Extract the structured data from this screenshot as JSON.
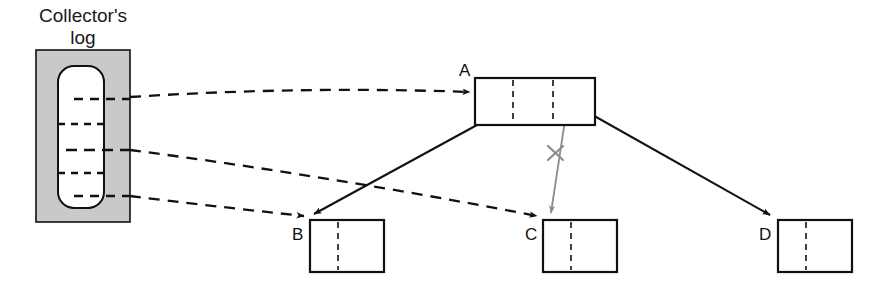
{
  "diagram": {
    "title": {
      "line1": "Collector's",
      "line2": "log"
    },
    "colors": {
      "stroke": "#111111",
      "log_fill": "#c9c9c9",
      "log_inner_fill": "#ffffff",
      "node_fill": "#ffffff",
      "cancelled_arrow": "#8c8c8c",
      "cross_mark": "#8c8c8c",
      "background": "#ffffff"
    },
    "log": {
      "name": "collectors-log",
      "outer": {
        "x": 36,
        "y": 50,
        "width": 94,
        "height": 172
      },
      "inner": {
        "x": 58,
        "y": 66,
        "width": 46,
        "height": 142,
        "rx": 16
      },
      "entries": [
        {
          "id": "entry-1",
          "y": 99,
          "kind": "linked",
          "x1": 74,
          "x2": 130
        },
        {
          "id": "entry-2",
          "y": 124,
          "kind": "plain",
          "x1": 58,
          "x2": 104
        },
        {
          "id": "entry-3",
          "y": 150,
          "kind": "linked",
          "x1": 66,
          "x2": 130
        },
        {
          "id": "entry-4",
          "y": 173,
          "kind": "plain",
          "x1": 58,
          "x2": 104
        },
        {
          "id": "entry-5",
          "y": 196,
          "kind": "linked",
          "x1": 74,
          "x2": 130
        }
      ]
    },
    "nodes": [
      {
        "id": "node-a",
        "label": "A",
        "label_x": 459,
        "label_y": 76,
        "box": {
          "x": 475,
          "y": 78,
          "width": 120,
          "height": 47
        },
        "dividers": [
          513,
          553
        ]
      },
      {
        "id": "node-b",
        "label": "B",
        "label_x": 295,
        "label_y": 239,
        "box": {
          "x": 310,
          "y": 220,
          "width": 74,
          "height": 52
        },
        "dividers": [
          338
        ]
      },
      {
        "id": "node-c",
        "label": "C",
        "label_x": 528,
        "label_y": 239,
        "box": {
          "x": 543,
          "y": 220,
          "width": 74,
          "height": 52
        },
        "dividers": [
          571
        ]
      },
      {
        "id": "node-d",
        "label": "D",
        "label_x": 762,
        "label_y": 239,
        "box": {
          "x": 778,
          "y": 220,
          "width": 74,
          "height": 52
        },
        "dividers": [
          806
        ]
      }
    ],
    "log_arrows": [
      {
        "id": "log-arrow-to-a",
        "style": "dashed",
        "from": {
          "x": 130,
          "y": 97
        },
        "ctrl": {
          "x": 300,
          "y": 86
        },
        "to": {
          "x": 472,
          "y": 92
        }
      },
      {
        "id": "log-arrow-to-c",
        "style": "dashed",
        "from": {
          "x": 130,
          "y": 150
        },
        "ctrl": {
          "x": 330,
          "y": 176
        },
        "to": {
          "x": 539,
          "y": 217
        }
      },
      {
        "id": "log-arrow-to-b",
        "style": "dashed",
        "from": {
          "x": 130,
          "y": 196
        },
        "ctrl": {
          "x": 210,
          "y": 206
        },
        "to": {
          "x": 306,
          "y": 217
        }
      }
    ],
    "node_arrows": [
      {
        "id": "arrow-a-to-b",
        "style": "solid",
        "color": "#111111",
        "from": {
          "x": 521,
          "y": 101
        },
        "to": {
          "x": 312,
          "y": 215
        }
      },
      {
        "id": "arrow-a-to-d",
        "style": "solid",
        "color": "#111111",
        "from": {
          "x": 566,
          "y": 100
        },
        "to": {
          "x": 772,
          "y": 216
        }
      },
      {
        "id": "arrow-a-to-c-cancelled",
        "style": "solid",
        "color": "#8c8c8c",
        "from": {
          "x": 568,
          "y": 100
        },
        "to": {
          "x": 551,
          "y": 214
        }
      }
    ],
    "cross_mark": {
      "id": "cancel-cross",
      "center": {
        "x": 556,
        "y": 153
      },
      "size": 10
    }
  }
}
